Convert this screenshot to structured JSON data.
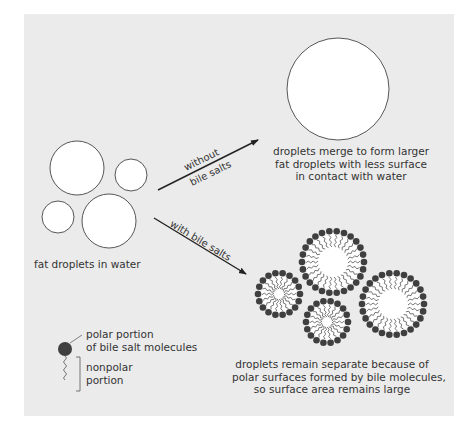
{
  "figure": {
    "background": "#ebebeb",
    "initial_state": {
      "caption": "fat droplets in water",
      "droplets": [
        {
          "cx": 77,
          "cy": 168,
          "r": 27
        },
        {
          "cx": 131,
          "cy": 175,
          "r": 16
        },
        {
          "cx": 58,
          "cy": 217,
          "r": 16
        },
        {
          "cx": 109,
          "cy": 221,
          "r": 27
        }
      ]
    },
    "path_without_bile": {
      "label_line1": "without",
      "label_line2": "bile salts",
      "result_caption_lines": [
        "droplets merge to form larger",
        "fat droplets with less surface",
        "in contact with water"
      ],
      "merged_droplet": {
        "cx": 338,
        "cy": 89,
        "r": 51
      }
    },
    "path_with_bile": {
      "label": "with bile salts",
      "result_caption_lines": [
        "droplets remain separate because of",
        "polar surfaces formed by bile molecules,",
        "so surface area remains large"
      ],
      "coated_droplets": [
        {
          "cx": 333,
          "cy": 262,
          "outer_r": 31,
          "inner_r": 14,
          "heads": 26
        },
        {
          "cx": 279,
          "cy": 294,
          "outer_r": 21,
          "inner_r": 4,
          "heads": 18
        },
        {
          "cx": 393,
          "cy": 304,
          "outer_r": 31,
          "inner_r": 14,
          "heads": 26
        },
        {
          "cx": 327,
          "cy": 322,
          "outer_r": 21,
          "inner_r": 4,
          "heads": 18
        }
      ]
    },
    "legend": {
      "polar_label_line1": "polar portion",
      "polar_label_line2": "of bile salt molecules",
      "nonpolar_label_line1": "nonpolar",
      "nonpolar_label_line2": "portion"
    },
    "colors": {
      "droplet_fill": "#ffffff",
      "outline": "#444444",
      "polar_head": "#3f3f3f",
      "tail": "#555555",
      "arrow": "#222222"
    }
  }
}
